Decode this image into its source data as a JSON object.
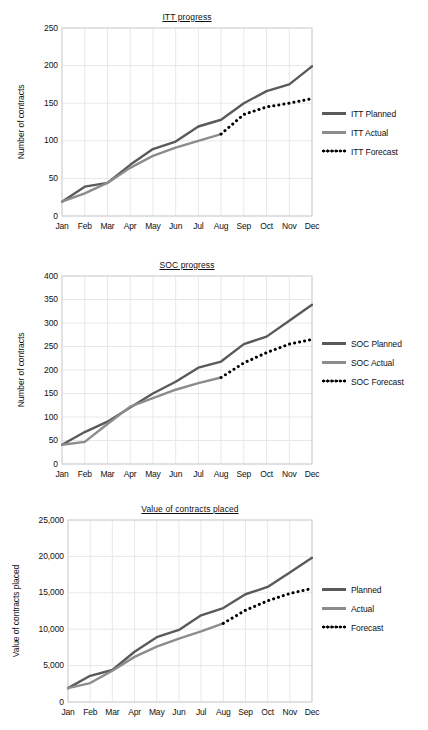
{
  "page": {
    "background": "#ffffff",
    "ghost_fragment": "",
    "width": 428,
    "height": 730
  },
  "palette": {
    "planned": "#5a5a5a",
    "actual": "#8c8c8c",
    "forecast": "#000000",
    "grid": "#e8e8e8",
    "axis": "#cfcfcf",
    "text": "#111111"
  },
  "chart_data": [
    {
      "id": "itt-progress",
      "type": "line",
      "title": "ITT progress",
      "xlabel": "",
      "ylabel": "Number of contracts",
      "categories": [
        "Jan",
        "Feb",
        "Mar",
        "Apr",
        "May",
        "Jun",
        "Jul",
        "Aug",
        "Sep",
        "Oct",
        "Nov",
        "Dec"
      ],
      "yticks": [
        "0",
        "50",
        "100",
        "150",
        "200",
        "250"
      ],
      "ytick_values": [
        0,
        50,
        100,
        150,
        200,
        250
      ],
      "ylim": [
        0,
        250
      ],
      "grid": true,
      "legend_position": "right",
      "series": [
        {
          "name": "ITT Planned",
          "style": "solid",
          "color": "#5a5a5a",
          "values": [
            19,
            39,
            44,
            68,
            89,
            99,
            119,
            128,
            150,
            166,
            175,
            199
          ]
        },
        {
          "name": "ITT Actual",
          "style": "solid",
          "color": "#8c8c8c",
          "values": [
            19,
            30,
            44,
            64,
            80,
            91,
            100,
            109,
            null,
            null,
            null,
            null
          ]
        },
        {
          "name": "ITT Forecast",
          "style": "dotted",
          "color": "#000000",
          "values": [
            null,
            null,
            null,
            null,
            null,
            null,
            null,
            109,
            135,
            145,
            150,
            156
          ]
        }
      ]
    },
    {
      "id": "soc-progress",
      "type": "line",
      "title": "SOC progress",
      "xlabel": "",
      "ylabel": "Number of contracts",
      "categories": [
        "Jan",
        "Feb",
        "Mar",
        "Apr",
        "May",
        "Jun",
        "Jul",
        "Aug",
        "Sep",
        "Oct",
        "Nov",
        "Dec"
      ],
      "yticks": [
        "0",
        "50",
        "100",
        "150",
        "200",
        "250",
        "300",
        "350",
        "400"
      ],
      "ytick_values": [
        0,
        50,
        100,
        150,
        200,
        250,
        300,
        350,
        400
      ],
      "ylim": [
        0,
        400
      ],
      "grid": true,
      "legend_position": "right",
      "series": [
        {
          "name": "SOC Planned",
          "style": "solid",
          "color": "#5a5a5a",
          "values": [
            41,
            68,
            90,
            120,
            150,
            175,
            205,
            218,
            255,
            271,
            305,
            339
          ]
        },
        {
          "name": "SOC Actual",
          "style": "solid",
          "color": "#8c8c8c",
          "values": [
            41,
            47,
            85,
            122,
            140,
            158,
            172,
            184,
            null,
            null,
            null,
            null
          ]
        },
        {
          "name": "SOC Forecast",
          "style": "dotted",
          "color": "#000000",
          "values": [
            null,
            null,
            null,
            null,
            null,
            null,
            null,
            184,
            215,
            237,
            255,
            265
          ]
        }
      ]
    },
    {
      "id": "value-of-contracts-placed",
      "type": "line",
      "title": "Value of contracts placed",
      "xlabel": "",
      "ylabel": "Value of contracts placed",
      "categories": [
        "Jan",
        "Feb",
        "Mar",
        "Apr",
        "May",
        "Jun",
        "Jul",
        "Aug",
        "Sep",
        "Oct",
        "Nov",
        "Dec"
      ],
      "yticks": [
        "0",
        "5,000",
        "10,000",
        "15,000",
        "20,000",
        "25,000"
      ],
      "ytick_values": [
        0,
        5000,
        10000,
        15000,
        20000,
        25000
      ],
      "ylim": [
        0,
        25000
      ],
      "grid": true,
      "legend_position": "right",
      "series": [
        {
          "name": "Planned",
          "style": "solid",
          "color": "#5a5a5a",
          "values": [
            1900,
            3600,
            4400,
            6900,
            8900,
            9900,
            11900,
            12900,
            14800,
            15800,
            17800,
            19800
          ]
        },
        {
          "name": "Actual",
          "style": "solid",
          "color": "#8c8c8c",
          "values": [
            1900,
            2600,
            4300,
            6200,
            7600,
            8700,
            9700,
            10800,
            null,
            null,
            null,
            null
          ]
        },
        {
          "name": "Forecast",
          "style": "dotted",
          "color": "#000000",
          "values": [
            null,
            null,
            null,
            null,
            null,
            null,
            null,
            10800,
            12600,
            13900,
            14900,
            15600
          ]
        }
      ]
    }
  ]
}
